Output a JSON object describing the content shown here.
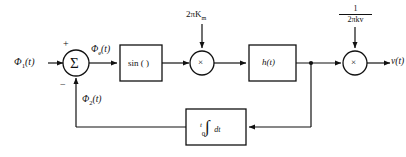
{
  "diagram": {
    "stroke_color": "#111111",
    "background_color": "#ffffff"
  },
  "labels": {
    "input_signal": "Φ",
    "input_signal_sub": "1",
    "input_signal_arg": "(t)",
    "error_signal": "Φ",
    "error_signal_sub": "e",
    "error_signal_arg": "(t)",
    "feedback_signal": "Φ",
    "feedback_signal_sub": "2",
    "feedback_signal_arg": "(t)",
    "output_signal": "v",
    "output_signal_arg": "(t)",
    "gain_top_left": "2πK",
    "gain_top_left_sub": "m",
    "gain_top_right_numerator": "1",
    "gain_top_right_denominator": "2πk",
    "gain_top_right_denominator_sub": "v"
  },
  "blocks": {
    "summer": {
      "symbol": "Σ",
      "plus_sign": "+",
      "minus_sign": "−"
    },
    "sine": {
      "label": "sin (  )"
    },
    "multiplier_1": {
      "symbol": "×"
    },
    "filter": {
      "label": "h(t)"
    },
    "multiplier_2": {
      "symbol": "×"
    },
    "integrator": {
      "symbol": "∫",
      "lower_limit": "0",
      "upper_limit": "t",
      "differential": "dt"
    }
  }
}
